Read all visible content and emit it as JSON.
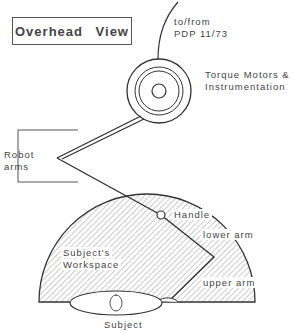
{
  "title": "Overhead View",
  "labels": {
    "cable_line1": "to/from",
    "cable_line2": "PDP  11/73",
    "motors_line1": "Torque Motors &",
    "motors_line2": "Instrumentation",
    "robot_line1": "Robot",
    "robot_line2": "arms",
    "handle": "Handle",
    "lower_arm": "lower  arm",
    "workspace_line1": "Subject's",
    "workspace_line2": "Workspace",
    "upper_arm": "upper  arm",
    "subject": "Subject"
  },
  "colors": {
    "line": "#333333",
    "hatch": "#888888",
    "background": "#ffffff"
  }
}
